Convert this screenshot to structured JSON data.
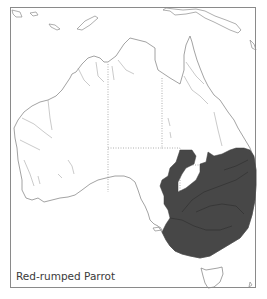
{
  "map": {
    "region": "Australia",
    "species_label": "Red-rumped Parrot",
    "colors": {
      "range_fill": "#474747",
      "coastline": "#8c8c8c",
      "background": "#ffffff",
      "frame": "#8a8a8a"
    },
    "legend": {
      "shaded_area": "distribution range"
    }
  }
}
